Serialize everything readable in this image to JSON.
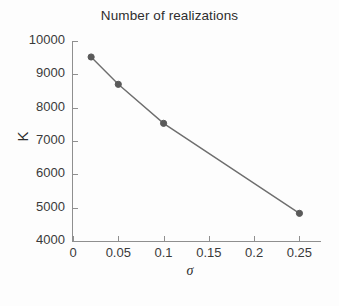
{
  "figure": {
    "title": "Number of realizations",
    "background_color": "#fdfdfd",
    "axis_color": "#8f8f8f",
    "text_color": "#3a3a3a"
  },
  "axes": {
    "ylabel": "K",
    "xlabel": "σ",
    "ytick_labels": [
      "10000",
      "9000",
      "8000",
      "7000",
      "6000",
      "5000",
      "4000"
    ],
    "xtick_labels": [
      "0",
      "0.05",
      "0.1",
      "0.15",
      "0.2",
      "0.25"
    ]
  },
  "chart_data": {
    "type": "line",
    "title": "Number of realizations",
    "xlabel": "σ",
    "ylabel": "K",
    "x": [
      0.02,
      0.05,
      0.1,
      0.25
    ],
    "values": [
      9520,
      8700,
      7530,
      4830
    ],
    "series": [
      {
        "name": "K",
        "x": [
          0.02,
          0.05,
          0.1,
          0.25
        ],
        "values": [
          9520,
          8700,
          7530,
          4830
        ],
        "line_color": "#6e6e6e",
        "marker_color": "#5a5a5a",
        "marker": "circle"
      }
    ],
    "xlim": [
      0,
      0.2727
    ],
    "ylim": [
      4000,
      10000
    ],
    "xticks": [
      0,
      0.05,
      0.1,
      0.15,
      0.2,
      0.25
    ],
    "yticks": [
      4000,
      5000,
      6000,
      7000,
      8000,
      9000,
      10000
    ],
    "grid": false,
    "legend": false
  }
}
